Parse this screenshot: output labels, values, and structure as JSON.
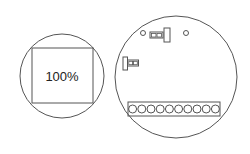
{
  "left_view": {
    "label": "100%",
    "shape": "circle-with-inscribed-square"
  },
  "right_view": {
    "shape": "circle-circuit-board",
    "terminal_block": {
      "count": 10
    },
    "components": [
      "small-hole-left",
      "small-hole-right",
      "double-pad-with-tab-top",
      "double-pad-with-tab-left",
      "terminal-strip"
    ]
  },
  "colors": {
    "stroke": "#555555",
    "background": "#ffffff",
    "text": "#222222"
  }
}
